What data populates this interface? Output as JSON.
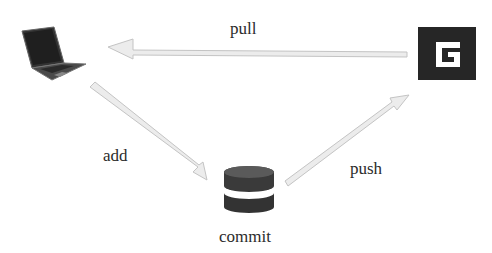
{
  "diagram": {
    "nodes": [
      {
        "id": "local",
        "icon": "laptop-icon",
        "label": ""
      },
      {
        "id": "remote",
        "icon": "g-logo-icon",
        "label": ""
      },
      {
        "id": "repo",
        "icon": "database-icon",
        "label": "commit"
      }
    ],
    "edges": [
      {
        "from": "remote",
        "to": "local",
        "label": "pull"
      },
      {
        "from": "local",
        "to": "repo",
        "label": "add"
      },
      {
        "from": "repo",
        "to": "remote",
        "label": "push"
      }
    ],
    "colors": {
      "arrow_fill": "#ececec",
      "arrow_stroke": "#c4c4c4",
      "icon_dark": "#2e2e2e",
      "logo_bg": "#262626",
      "text": "#2b2b2b"
    }
  }
}
